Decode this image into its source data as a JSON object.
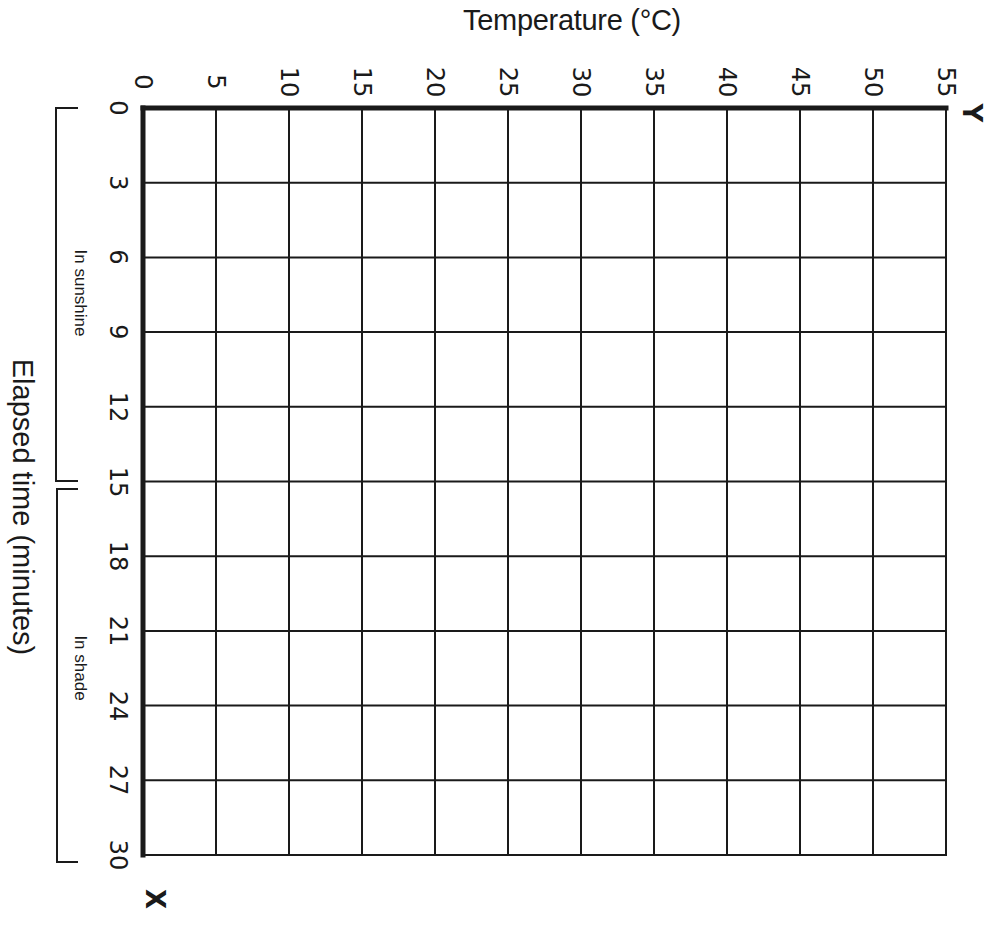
{
  "chart_data": {
    "type": "line",
    "title": "",
    "top_axis_label": "Temperature (°C)",
    "left_axis_label": "Elapsed time (minutes)",
    "x_axis_marker": "X",
    "y_axis_marker": "Y",
    "temperature_ticks": [
      "0",
      "5",
      "10",
      "15",
      "20",
      "25",
      "30",
      "35",
      "40",
      "45",
      "50",
      "55"
    ],
    "time_ticks": [
      "0",
      "3",
      "6",
      "9",
      "12",
      "15",
      "18",
      "21",
      "24",
      "27",
      "30"
    ],
    "xlabel": "Elapsed time (minutes)",
    "ylabel": "Temperature (°C)",
    "xlim": [
      0,
      30
    ],
    "ylim": [
      0,
      55
    ],
    "grid": true,
    "orientation": "rotated 90° clockwise (blank worksheet graph)",
    "brackets": [
      {
        "label": "In sunshine",
        "from": 0,
        "to": 15
      },
      {
        "label": "In shade",
        "from": 15,
        "to": 30
      }
    ],
    "series": []
  },
  "labels": {
    "title": "Temperature (°C)",
    "elapsed": "Elapsed time (minutes)",
    "sunshine": "In sunshine",
    "shade": "In shade",
    "x_marker": "X",
    "y_marker": "Y"
  },
  "colors": {
    "ink": "#1a1a1a",
    "paper": "#ffffff"
  }
}
